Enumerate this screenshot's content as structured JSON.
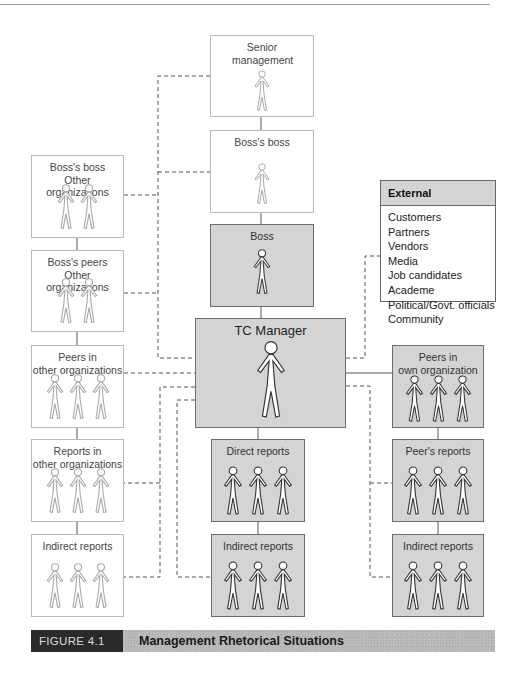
{
  "figure": {
    "number_label": "FIGURE 4.1",
    "title": "Management Rhetorical Situations"
  },
  "colors": {
    "highlight_box_fill": "#d4d4d4",
    "highlight_box_border": "#6d6d6d",
    "light_box_border": "#b9b9b9",
    "caption_dark": "#2a2a2a",
    "caption_texture": "#b9b9b9",
    "connector": "#555555"
  },
  "center_column": {
    "senior_management": {
      "label": "Senior management",
      "people": 1,
      "style": "light"
    },
    "bosss_boss": {
      "label": "Boss's boss",
      "people": 1,
      "style": "light"
    },
    "boss": {
      "label": "Boss",
      "people": 1,
      "style": "gray"
    },
    "tc_manager": {
      "label": "TC Manager",
      "people": 1,
      "style": "gray"
    },
    "direct_reports": {
      "label": "Direct reports",
      "people": 3,
      "style": "gray"
    },
    "indirect_reports": {
      "label": "Indirect reports",
      "people": 3,
      "style": "gray"
    }
  },
  "left_column": {
    "bosss_boss_other": {
      "label_line1": "Boss's boss",
      "label_line2": "Other organizations",
      "people": 2,
      "style": "light"
    },
    "bosss_peers_other": {
      "label_line1": "Boss's peers",
      "label_line2": "Other organizations",
      "people": 2,
      "style": "light"
    },
    "peers_other": {
      "label_line1": "Peers in",
      "label_line2": "other organizations",
      "people": 3,
      "style": "light"
    },
    "reports_other": {
      "label_line1": "Reports in",
      "label_line2": "other organizations",
      "people": 3,
      "style": "light"
    },
    "indirect_reports_left": {
      "label": "Indirect reports",
      "people": 3,
      "style": "light"
    }
  },
  "right_column": {
    "peers_own": {
      "label_line1": "Peers in",
      "label_line2": "own organization",
      "people": 3,
      "style": "gray"
    },
    "peers_reports": {
      "label": "Peer's reports",
      "people": 3,
      "style": "gray"
    },
    "indirect_reports_right": {
      "label": "Indirect reports",
      "people": 3,
      "style": "gray"
    }
  },
  "external": {
    "header": "External",
    "items": [
      "Customers",
      "Partners",
      "Vendors",
      "Media",
      "Job candidates",
      "Academe",
      "Political/Govt. officials",
      "Community"
    ]
  }
}
